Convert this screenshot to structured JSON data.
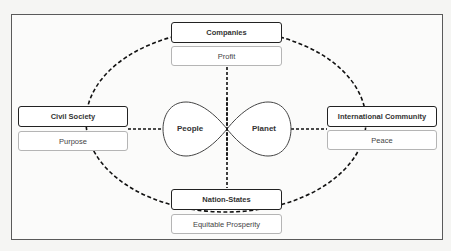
{
  "diagram": {
    "type": "stakeholder-cycle",
    "center": {
      "shape": "infinity",
      "left_label": "People",
      "right_label": "Planet"
    },
    "nodes": [
      {
        "id": "top",
        "actor": "Companies",
        "value": "Profit"
      },
      {
        "id": "left",
        "actor": "Civil Society",
        "value": "Purpose"
      },
      {
        "id": "right",
        "actor": "International Community",
        "value": "Peace"
      },
      {
        "id": "bottom",
        "actor": "Nation-States",
        "value": "Equitable Prosperity"
      }
    ],
    "connections": {
      "outer_ring": "dashed ellipse linking all four actors",
      "axes": "dashed lines from center to each actor"
    },
    "colors": {
      "actor_border": "#222222",
      "value_border": "#b5b5b5",
      "dashed_line": "#111111",
      "frame_border": "#5a5a5a"
    }
  }
}
